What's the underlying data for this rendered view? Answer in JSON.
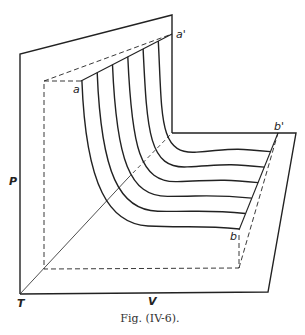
{
  "figure": {
    "caption": "Fig. (IV-6).",
    "labels": {
      "a": "a",
      "a_prime": "a'",
      "b": "b",
      "b_prime": "b'",
      "p_axis": "P",
      "t_axis": "T",
      "v_axis": "V"
    },
    "curve_count": 6,
    "line_color": "#222222"
  }
}
